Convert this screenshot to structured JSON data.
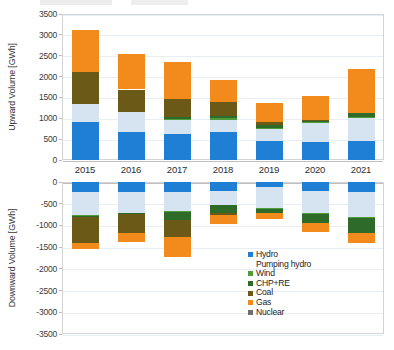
{
  "figure": {
    "x_categories": [
      "2015",
      "2016",
      "2017",
      "2018",
      "2019",
      "2020",
      "2021"
    ]
  },
  "legend": {
    "items": [
      {
        "label": "Hydro",
        "color": "#1f7fd4",
        "swatch": true
      },
      {
        "label": "Pumping hydro",
        "color": "#d6e4f2",
        "swatch": false
      },
      {
        "label": "Wind",
        "color": "#4e9d3a",
        "swatch": true
      },
      {
        "label": "CHP+RE",
        "color": "#2f6b28",
        "swatch": true
      },
      {
        "label": "Coal",
        "color": "#6b5a17",
        "swatch": true
      },
      {
        "label": "Gas",
        "color": "#f28b1c",
        "swatch": true
      },
      {
        "label": "Nuclear",
        "color": "#6f6f6f",
        "swatch": true
      }
    ]
  },
  "chart_data": [
    {
      "type": "bar",
      "stacked": true,
      "title": "",
      "xlabel": "",
      "ylabel": "Upward Volume [GWh]",
      "ylim": [
        0,
        3500
      ],
      "yticks": [
        0,
        500,
        1000,
        1500,
        2000,
        2500,
        3000,
        3500
      ],
      "ytick_labels": [
        "0",
        "500",
        "1000",
        "1500",
        "2000",
        "2500",
        "3000",
        "3500"
      ],
      "grid": true,
      "legend_position": "outside-bottom-right",
      "categories": [
        "2015",
        "2016",
        "2017",
        "2018",
        "2019",
        "2020",
        "2021"
      ],
      "series": [
        {
          "name": "Hydro",
          "color": "#1f7fd4",
          "values": [
            920,
            660,
            630,
            680,
            450,
            420,
            460
          ]
        },
        {
          "name": "Pumping hydro",
          "color": "#d6e4f2",
          "values": [
            420,
            480,
            330,
            275,
            305,
            490,
            540
          ]
        },
        {
          "name": "Wind",
          "color": "#4e9d3a",
          "values": [
            0,
            0,
            30,
            40,
            10,
            10,
            20
          ]
        },
        {
          "name": "CHP+RE",
          "color": "#2f6b28",
          "values": [
            0,
            0,
            35,
            55,
            65,
            30,
            100
          ]
        },
        {
          "name": "Coal",
          "color": "#6b5a17",
          "values": [
            780,
            550,
            430,
            330,
            75,
            10,
            0
          ]
        },
        {
          "name": "Gas",
          "color": "#f28b1c",
          "values": [
            1000,
            860,
            890,
            530,
            450,
            580,
            1050
          ]
        },
        {
          "name": "Nuclear",
          "color": "#6f6f6f",
          "values": [
            0,
            0,
            0,
            0,
            0,
            0,
            0
          ]
        }
      ],
      "totals": [
        3120,
        2550,
        2345,
        1910,
        1355,
        1540,
        2170
      ]
    },
    {
      "type": "bar",
      "stacked": true,
      "title": "",
      "xlabel": "",
      "ylabel": "Downward Volume [GWh]",
      "ylim": [
        -3500,
        0
      ],
      "yticks": [
        0,
        -500,
        -1000,
        -1500,
        -2000,
        -2500,
        -3000,
        -3500
      ],
      "ytick_labels": [
        "0",
        "-500",
        "-1000",
        "-1500",
        "-2000",
        "-2500",
        "-3000",
        "-3500"
      ],
      "grid": true,
      "categories": [
        "2015",
        "2016",
        "2017",
        "2018",
        "2019",
        "2020",
        "2021"
      ],
      "series": [
        {
          "name": "Hydro",
          "color": "#1f7fd4",
          "values": [
            -240,
            -240,
            -225,
            -215,
            -115,
            -200,
            -235
          ]
        },
        {
          "name": "Pumping hydro",
          "color": "#d6e4f2",
          "values": [
            -530,
            -470,
            -440,
            -305,
            -495,
            -520,
            -580
          ]
        },
        {
          "name": "Wind",
          "color": "#4e9d3a",
          "values": [
            -10,
            -10,
            -20,
            -15,
            -15,
            -20,
            -25
          ]
        },
        {
          "name": "CHP+RE",
          "color": "#2f6b28",
          "values": [
            -15,
            -25,
            -185,
            -175,
            -95,
            -195,
            -330
          ]
        },
        {
          "name": "Coal",
          "color": "#6b5a17",
          "values": [
            -620,
            -420,
            -390,
            -50,
            0,
            0,
            0
          ]
        },
        {
          "name": "Gas",
          "color": "#f28b1c",
          "values": [
            -120,
            -210,
            -460,
            -200,
            -130,
            -210,
            -230
          ]
        },
        {
          "name": "Nuclear",
          "color": "#6f6f6f",
          "values": [
            0,
            0,
            0,
            0,
            0,
            0,
            0
          ]
        }
      ],
      "totals": [
        -1535,
        -1375,
        -1720,
        -960,
        -850,
        -1145,
        -1400
      ]
    }
  ]
}
